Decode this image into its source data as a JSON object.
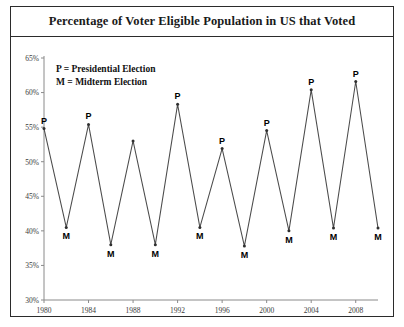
{
  "chart_data": {
    "type": "line",
    "title": "Percentage of Voter Eligible Population in US that Voted",
    "xlabel": "",
    "ylabel": "",
    "ylim": [
      30,
      65
    ],
    "ytick_values": [
      30,
      35,
      40,
      45,
      50,
      55,
      60,
      65
    ],
    "ytick_labels": [
      "30%",
      "35%",
      "40%",
      "45%",
      "50%",
      "55%",
      "60%",
      "65%"
    ],
    "xlim": [
      1980,
      2010
    ],
    "xtick_values": [
      1980,
      1984,
      1988,
      1992,
      1996,
      2000,
      2004,
      2008
    ],
    "xtick_labels": [
      "1980",
      "1984",
      "1988",
      "1992",
      "1996",
      "2000",
      "2004",
      "2008"
    ],
    "grid": false,
    "legend_position": "upper-left-inside",
    "legend": [
      "P = Presidential Election",
      "M = Midterm Election"
    ],
    "series": [
      {
        "name": "Voter turnout",
        "x": [
          1980,
          1982,
          1984,
          1986,
          1988,
          1990,
          1992,
          1994,
          1996,
          1998,
          2000,
          2002,
          2004,
          2006,
          2008,
          2010
        ],
        "values": [
          54.8,
          40.5,
          55.4,
          38.0,
          53.0,
          38.0,
          58.3,
          40.5,
          51.9,
          37.8,
          54.5,
          40.0,
          60.4,
          40.4,
          61.6,
          40.4
        ],
        "point_labels": [
          "P",
          "M",
          "P",
          "M",
          "P",
          "M",
          "P",
          "M",
          "P",
          "M",
          "P",
          "M",
          "P",
          "M",
          "P",
          "M"
        ],
        "label_positions": [
          "above",
          "below",
          "above",
          "below",
          "none",
          "below",
          "above",
          "below",
          "above",
          "below",
          "above",
          "below",
          "above",
          "below",
          "above",
          "below"
        ]
      }
    ]
  },
  "colors": {
    "frame": "#2b2b2b",
    "axis": "#8a8a8a",
    "line": "#4b4b4b",
    "text": "#1a1a1a",
    "background": "#ffffff"
  }
}
